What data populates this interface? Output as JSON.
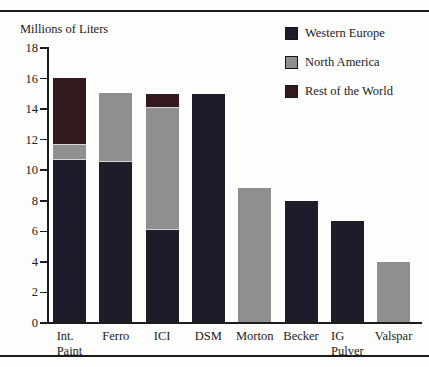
{
  "chart_data": {
    "type": "bar",
    "stacked": true,
    "title": "Millions of Liters",
    "ylabel": "Millions of Liters",
    "categories": [
      "Int.\nPaint",
      "Ferro",
      "ICI",
      "DSM",
      "Morton",
      "Becker",
      "IG\nPulver",
      "Valspar"
    ],
    "series": [
      {
        "name": "Western Europe",
        "color": "#1e1c2b",
        "values": [
          10.6,
          10.5,
          6.0,
          14.9,
          0,
          7.9,
          6.6,
          0
        ]
      },
      {
        "name": "North America",
        "color": "#8f8f8f",
        "values": [
          1.0,
          4.5,
          8.0,
          0,
          8.8,
          0,
          0,
          3.9
        ]
      },
      {
        "name": "Rest of the World",
        "color": "#33181d",
        "values": [
          4.4,
          0,
          0.9,
          0,
          0,
          0,
          0,
          0
        ]
      }
    ],
    "totals": [
      16.0,
      15.0,
      14.9,
      14.9,
      8.8,
      7.9,
      6.6,
      3.9
    ],
    "ylim": [
      0,
      18
    ],
    "ytick_step": 2,
    "ytick_labels": [
      "0",
      "2",
      "4",
      "6",
      "8",
      "10",
      "12",
      "14",
      "16",
      "18"
    ],
    "legend_position": "top-right",
    "grid": false
  }
}
